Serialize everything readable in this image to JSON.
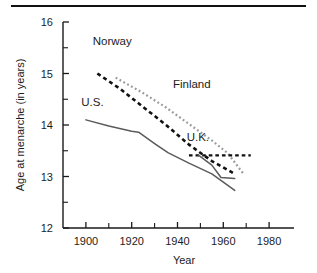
{
  "chart_data": {
    "type": "line",
    "title": "",
    "xlabel": "Year",
    "ylabel": "Age at menarche (in years)",
    "xlim": [
      1890,
      1990
    ],
    "ylim": [
      12,
      16
    ],
    "grid": false,
    "legend_position": "inline-annotations",
    "x_ticks_major": [
      1900,
      1920,
      1940,
      1960,
      1980
    ],
    "x_ticks_minor": [
      1910,
      1930,
      1950,
      1970
    ],
    "y_ticks_major": [
      12,
      13,
      14,
      15,
      16
    ],
    "y_ticks_minor": [
      12.5,
      13.5,
      14.5,
      15.5
    ],
    "x_tick_labels": [
      "1900",
      "1920",
      "1940",
      "1960",
      "1980"
    ],
    "y_tick_labels": [
      "12",
      "13",
      "14",
      "15",
      "16"
    ],
    "series": [
      {
        "name": "Norway",
        "style": "dashed",
        "color": "#111111",
        "width": 2.6,
        "label_x": 1903,
        "label_y": 15.55,
        "points": [
          [
            1905,
            15.0
          ],
          [
            1915,
            14.7
          ],
          [
            1925,
            14.35
          ],
          [
            1935,
            14.0
          ],
          [
            1945,
            13.62
          ],
          [
            1955,
            13.3
          ],
          [
            1965,
            13.05
          ]
        ]
      },
      {
        "name": "Finland",
        "style": "dotted",
        "color": "#9a9a9a",
        "width": 2.2,
        "label_x": 1938,
        "label_y": 14.72,
        "points": [
          [
            1913,
            14.92
          ],
          [
            1925,
            14.62
          ],
          [
            1935,
            14.34
          ],
          [
            1945,
            14.02
          ],
          [
            1955,
            13.7
          ],
          [
            1962,
            13.45
          ],
          [
            1969,
            13.04
          ]
        ]
      },
      {
        "name": "U.S.",
        "style": "solid",
        "color": "#5a5a5a",
        "width": 1.5,
        "label_x": 1898,
        "label_y": 14.36,
        "points": [
          [
            1900,
            14.1
          ],
          [
            1910,
            13.98
          ],
          [
            1920,
            13.88
          ],
          [
            1923,
            13.86
          ],
          [
            1930,
            13.64
          ],
          [
            1936,
            13.46
          ],
          [
            1945,
            13.26
          ],
          [
            1955,
            13.05
          ],
          [
            1965,
            12.73
          ]
        ]
      },
      {
        "name": "U.K.",
        "style": "dashed",
        "color": "#111111",
        "width": 2.4,
        "label_x": 1944,
        "label_y": 13.68,
        "points": [
          [
            1945,
            13.41
          ],
          [
            1955,
            13.41
          ],
          [
            1963,
            13.41
          ],
          [
            1972,
            13.41
          ]
        ],
        "solid_branch": {
          "style": "solid",
          "color": "#5a5a5a",
          "width": 1.5,
          "points": [
            [
              1949,
              13.42
            ],
            [
              1955,
              13.22
            ],
            [
              1959,
              12.98
            ],
            [
              1965,
              12.96
            ]
          ]
        }
      }
    ]
  },
  "axes": {
    "y_title": "Age at menarche (in years)",
    "x_title": "Year"
  }
}
